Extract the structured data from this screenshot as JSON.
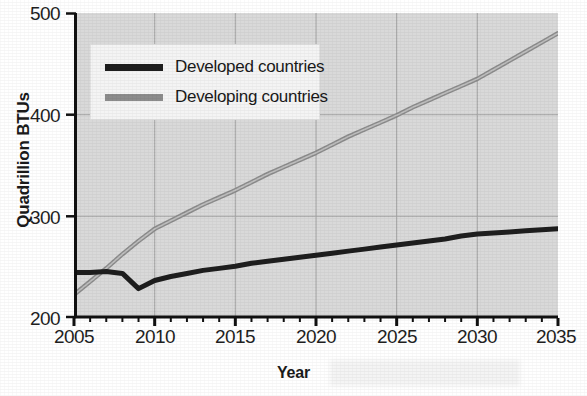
{
  "chart_data": {
    "type": "line",
    "title": "",
    "xlabel": "Year",
    "ylabel": "Quadrillion BTUs",
    "xlim": [
      2005,
      2035
    ],
    "ylim": [
      200,
      500
    ],
    "xticks": [
      "2005",
      "2010",
      "2015",
      "2020",
      "2025",
      "2030",
      "2035"
    ],
    "yticks": [
      "200",
      "300",
      "400",
      "500"
    ],
    "x_minor_tick_interval": 1,
    "grid": true,
    "grid_x_values": [
      2010,
      2015,
      2020,
      2025,
      2030
    ],
    "grid_y_values": [
      300,
      400
    ],
    "legend_position": "upper-left-inside",
    "x": [
      2005,
      2006,
      2007,
      2008,
      2009,
      2010,
      2011,
      2012,
      2013,
      2014,
      2015,
      2016,
      2017,
      2018,
      2019,
      2020,
      2021,
      2022,
      2023,
      2024,
      2025,
      2026,
      2027,
      2028,
      2029,
      2030,
      2031,
      2032,
      2033,
      2034,
      2035
    ],
    "series": [
      {
        "name": "Developed countries",
        "color": "#1e1e1e",
        "values": [
          244,
          244,
          245,
          243,
          228,
          236,
          240,
          243,
          246,
          248,
          250,
          253,
          255,
          257,
          259,
          261,
          263,
          265,
          267,
          269,
          271,
          273,
          275,
          277,
          280,
          282,
          283,
          284,
          285,
          286,
          287
        ]
      },
      {
        "name": "Developing countries",
        "color": "#8c8c8c",
        "values": [
          222,
          235,
          248,
          262,
          275,
          287,
          295,
          303,
          311,
          318,
          325,
          333,
          341,
          348,
          355,
          362,
          370,
          378,
          385,
          392,
          399,
          407,
          414,
          421,
          428,
          435,
          444,
          453,
          462,
          471,
          480
        ]
      }
    ]
  },
  "legend": {
    "items": [
      {
        "label": "Developed countries",
        "color": "#1e1e1e"
      },
      {
        "label": "Developing countries",
        "color": "#8c8c8c"
      }
    ]
  },
  "colors": {
    "plot_background": "#d9d9d9",
    "grid": "#a9a9a9",
    "axis": "#111111",
    "developed": "#1e1e1e",
    "developing": "#8c8c8c",
    "legend_background": "#f4f4f4",
    "page_background": "#ffffff"
  }
}
